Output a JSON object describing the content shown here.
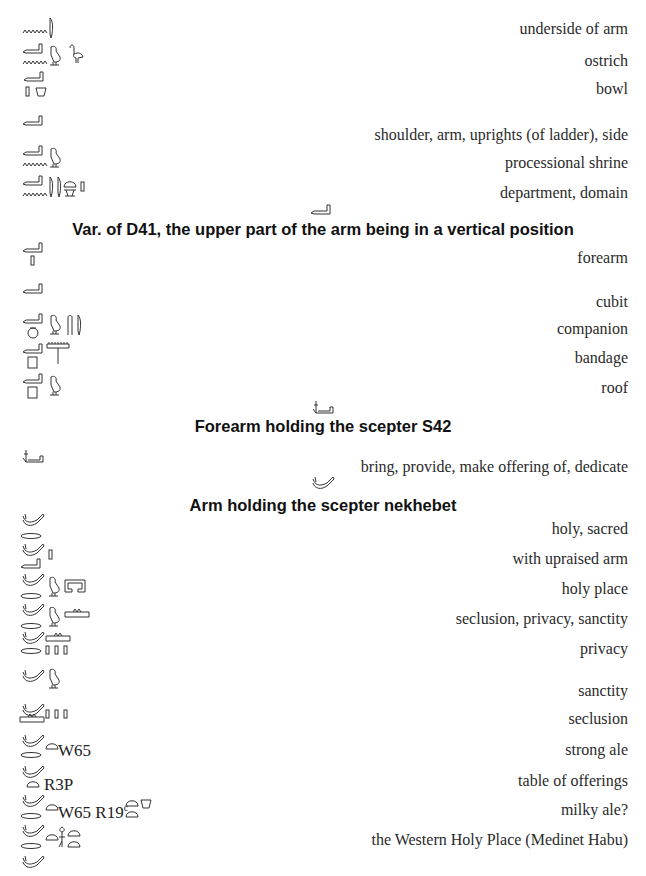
{
  "page": {
    "section_a": {
      "entries": [
        {
          "glyphs": [
            "water-ripple-N35",
            "reed-leaf-M17"
          ],
          "gloss": "underside of arm"
        },
        {
          "glyphs": [
            "arm-D41",
            "water-ripple-N35",
            "quail-chick-G43",
            "ostrich-G21"
          ],
          "gloss": "ostrich"
        },
        {
          "glyphs": [
            "arm-D41",
            "stroke-Z1",
            "bowl-W24"
          ],
          "gloss": "bowl"
        },
        {
          "glyphs": [
            "arm-D41"
          ],
          "gloss": "shoulder, arm, uprights (of ladder), side"
        },
        {
          "glyphs": [
            "arm-D41",
            "water-ripple-N35",
            "quail-chick-G43"
          ],
          "gloss": "processional shrine"
        },
        {
          "glyphs": [
            "arm-D41",
            "water-ripple-N35",
            "reed-leaf-M17",
            "reed-leaf-M17",
            "loaf-X1",
            "stroke-Z1"
          ],
          "gloss": "department, domain"
        }
      ]
    },
    "section_b": {
      "heading_glyph": "arm-vertical-D41-var",
      "heading": "Var. of D41, the upper part of the arm being in a vertical position",
      "entries": [
        {
          "glyphs": [
            "arm-vertical",
            "stroke-Z1"
          ],
          "gloss": "forearm"
        },
        {
          "glyphs": [
            "arm-vertical"
          ],
          "gloss": "cubit"
        },
        {
          "glyphs": [
            "arm-vertical",
            "pot-W24",
            "quail-chick-G43",
            "crook",
            "reed-leaf-M17"
          ],
          "gloss": "companion"
        },
        {
          "glyphs": [
            "arm-vertical",
            "stool-Q3",
            "comb-tree"
          ],
          "gloss": "bandage"
        },
        {
          "glyphs": [
            "arm-vertical",
            "stool-Q3",
            "quail-chick-G43"
          ],
          "gloss": "roof"
        }
      ]
    },
    "section_c": {
      "heading_glyph": "forearm-holding-scepter-S42",
      "heading": "Forearm holding the scepter S42",
      "entries": [
        {
          "glyphs": [
            "forearm-holding-scepter"
          ],
          "gloss": "bring, provide, make offering of, dedicate"
        }
      ]
    },
    "section_d": {
      "heading_glyph": "arm-holding-nekhebet",
      "heading": "Arm holding the scepter nekhebet",
      "entries": [
        {
          "glyphs": [
            "arm-nekhebet",
            "mouth-D21"
          ],
          "gloss": "holy, sacred"
        },
        {
          "glyphs": [
            "arm-nekhebet",
            "arm-vertical",
            "stroke-Z1"
          ],
          "gloss": "with upraised arm"
        },
        {
          "glyphs": [
            "arm-nekhebet",
            "mouth-D21",
            "quail-chick-G43",
            "enclosure-O1"
          ],
          "gloss": "holy place"
        },
        {
          "glyphs": [
            "arm-nekhebet",
            "mouth-D21",
            "quail-chick-G43",
            "altar-R3"
          ],
          "gloss": "seclusion, privacy, sanctity"
        },
        {
          "glyphs": [
            "arm-nekhebet",
            "altar-R3",
            "mouth-D21",
            "plural-strokes"
          ],
          "gloss": "privacy"
        },
        {
          "glyphs": [
            "arm-nekhebet",
            "quail-chick-G43"
          ],
          "gloss": "sanctity"
        },
        {
          "glyphs": [
            "arm-nekhebet",
            "altar-R3",
            "plural-strokes"
          ],
          "gloss": "seclusion"
        },
        {
          "glyphs": [
            "arm-nekhebet",
            "mouth-D21",
            "bread-X1"
          ],
          "code": "W65",
          "gloss": "strong ale"
        },
        {
          "glyphs": [
            "arm-nekhebet",
            "bread-X1"
          ],
          "code": "R3P",
          "gloss": "table of offerings"
        },
        {
          "glyphs": [
            "arm-nekhebet",
            "mouth-D21",
            "bread-X1",
            "bread-X1",
            "bread-X1",
            "bowl-W24"
          ],
          "code": "W65 R19",
          "code_sup": "c",
          "gloss": "milky ale?"
        },
        {
          "glyphs": [
            "arm-nekhebet",
            "mouth-D21",
            "bread-X1",
            "west-sign-R14",
            "bread-X1",
            "bread-X1"
          ],
          "gloss": "the Western Holy Place (Medinet Habu)"
        },
        {
          "glyphs": [
            "arm-nekhebet"
          ],
          "gloss": ""
        }
      ]
    }
  }
}
